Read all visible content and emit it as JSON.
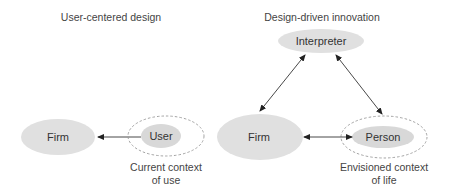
{
  "diagram": {
    "colors": {
      "node_fill": "#e0e0e0",
      "line": "#333333",
      "dashed": "#999999",
      "text": "#333333"
    },
    "left": {
      "title": "User-centered design",
      "nodes": {
        "firm": "Firm",
        "user": "User"
      },
      "context_caption": [
        "Current context",
        "of use"
      ],
      "edges": [
        {
          "from": "User",
          "to": "Firm",
          "type": "arrow"
        }
      ]
    },
    "right": {
      "title": "Design-driven innovation",
      "nodes": {
        "interpreter": "Interpreter",
        "firm": "Firm",
        "person": "Person"
      },
      "context_caption": [
        "Envisioned context",
        "of life"
      ],
      "edges": [
        {
          "from": "Interpreter",
          "to": "Firm",
          "type": "bidirectional"
        },
        {
          "from": "Interpreter",
          "to": "Person",
          "type": "bidirectional"
        },
        {
          "from": "Firm",
          "to": "Person",
          "type": "bidirectional"
        }
      ]
    }
  }
}
